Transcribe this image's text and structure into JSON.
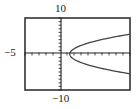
{
  "chart_data": {
    "type": "line",
    "title": "",
    "xlabel": "",
    "ylabel": "",
    "labels": {
      "ymax": "10",
      "ymin": "−10",
      "xmin": "−5"
    },
    "xlim": [
      -5,
      10
    ],
    "ylim": [
      -10,
      10
    ],
    "xlim_note": "Only the left bound (-5) is printed. The right bound of 10 is estimated from pixel spacing; Xmax is not shown in the image.",
    "grid": false,
    "legend": null,
    "ticks": {
      "x_axis_ticks": true,
      "y_axis_ticks": true
    },
    "series": [
      {
        "name": "sideways parabola (opening right)",
        "description": "Sideways parabola with its vertex on the x-axis, opening to the right. Equation not shown in the image and not determined.",
        "vertex_approx": [
          1.4,
          0
        ],
        "upper_branch_end_approx": [
          10,
          5.5
        ],
        "lower_branch_end_approx": [
          10,
          -5.5
        ],
        "coordinates_note": "Data coordinates are approximate, read from a low-resolution sketch under the estimated x-range above."
      }
    ]
  },
  "labels": {
    "top": "10",
    "bottom": "−10",
    "left": "−5"
  },
  "colors": {
    "frame": "#333333",
    "axes": "#222222",
    "curve": "#444444",
    "background": "#ffffff"
  }
}
